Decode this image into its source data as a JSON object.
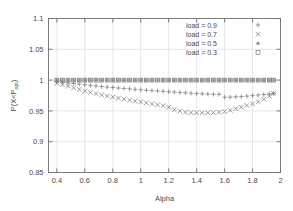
{
  "chart_data": {
    "type": "scatter",
    "title": "",
    "xlabel": "Alpha",
    "ylabel": "P(X<P_opt)",
    "ylabel_main": "P(X<P",
    "ylabel_sub": "opt",
    "ylabel_tail": ")",
    "xlim": [
      0.34,
      2.0
    ],
    "ylim": [
      0.85,
      1.1
    ],
    "xticks": [
      "0.4",
      "0.6",
      "0.8",
      "1",
      "1.2",
      "1.4",
      "1.6",
      "1.8",
      "2"
    ],
    "xtick_values": [
      0.4,
      0.6,
      0.8,
      1.0,
      1.2,
      1.4,
      1.6,
      1.8,
      2.0
    ],
    "yticks": [
      "0.85",
      "0.9",
      "0.95",
      "1",
      "1.05",
      "1.1"
    ],
    "ytick_values": [
      0.85,
      0.9,
      0.95,
      1.0,
      1.05,
      1.1
    ],
    "grid": true,
    "legend_position": "top-right",
    "x": [
      0.4,
      0.44,
      0.48,
      0.52,
      0.56,
      0.6,
      0.64,
      0.68,
      0.72,
      0.76,
      0.8,
      0.84,
      0.88,
      0.92,
      0.96,
      1.0,
      1.04,
      1.08,
      1.12,
      1.16,
      1.2,
      1.24,
      1.28,
      1.32,
      1.36,
      1.4,
      1.44,
      1.48,
      1.52,
      1.56,
      1.6,
      1.64,
      1.68,
      1.72,
      1.76,
      1.8,
      1.84,
      1.88,
      1.92,
      1.95
    ],
    "series": [
      {
        "name": "load = 0.9",
        "marker": "plus",
        "values": [
          0.9975,
          0.9965,
          0.9955,
          0.9945,
          0.9935,
          0.9925,
          0.9915,
          0.9905,
          0.9895,
          0.9888,
          0.988,
          0.9872,
          0.9865,
          0.9858,
          0.985,
          0.9843,
          0.9836,
          0.983,
          0.9824,
          0.9818,
          0.9812,
          0.9806,
          0.98,
          0.9794,
          0.9788,
          0.9782,
          0.9778,
          0.9774,
          0.9771,
          0.9769,
          0.9722,
          0.9724,
          0.9728,
          0.9733,
          0.974,
          0.9748,
          0.9757,
          0.9766,
          0.9775,
          0.9782
        ]
      },
      {
        "name": "load = 0.7",
        "marker": "cross",
        "values": [
          0.995,
          0.9925,
          0.99,
          0.9875,
          0.985,
          0.982,
          0.98,
          0.978,
          0.976,
          0.9742,
          0.9725,
          0.9708,
          0.9692,
          0.9675,
          0.966,
          0.9645,
          0.963,
          0.9615,
          0.96,
          0.9585,
          0.956,
          0.952,
          0.9498,
          0.9478,
          0.9472,
          0.947,
          0.947,
          0.947,
          0.9472,
          0.9478,
          0.949,
          0.951,
          0.9535,
          0.956,
          0.9588,
          0.9615,
          0.965,
          0.969,
          0.974,
          0.9785
        ]
      },
      {
        "name": "load = 0.5",
        "marker": "star",
        "values": [
          1.0,
          1.0,
          1.0,
          1.0,
          1.0,
          1.0,
          1.0,
          1.0,
          1.0,
          1.0,
          1.0,
          1.0,
          1.0,
          1.0,
          1.0,
          1.0,
          1.0,
          1.0,
          1.0,
          1.0,
          1.0,
          1.0,
          1.0,
          1.0,
          1.0,
          1.0,
          1.0,
          1.0,
          1.0,
          1.0,
          1.0,
          1.0,
          1.0,
          1.0,
          1.0,
          1.0,
          1.0,
          1.0,
          1.0,
          1.0
        ]
      },
      {
        "name": "load = 0.3",
        "marker": "square",
        "values": [
          1.0,
          1.0,
          1.0,
          1.0,
          1.0,
          1.0,
          1.0,
          1.0,
          1.0,
          1.0,
          1.0,
          1.0,
          1.0,
          1.0,
          1.0,
          1.0,
          1.0,
          1.0,
          1.0,
          1.0,
          1.0,
          1.0,
          1.0,
          1.0,
          1.0,
          1.0,
          1.0,
          1.0,
          1.0,
          1.0,
          1.0,
          1.0,
          1.0,
          1.0,
          1.0,
          1.0,
          1.0,
          1.0,
          1.0,
          1.0
        ]
      }
    ],
    "legend": [
      {
        "label": "load = 0.9",
        "marker": "plus"
      },
      {
        "label": "load = 0.7",
        "marker": "cross"
      },
      {
        "label": "load = 0.5",
        "marker": "star"
      },
      {
        "label": "load = 0.3",
        "marker": "square"
      }
    ],
    "colors": {
      "axis": "#6e6e6e",
      "grid": "#d5d5d5",
      "marker": "#7a7a7a",
      "text": "#4a4a4a",
      "background": "#ffffff"
    }
  }
}
